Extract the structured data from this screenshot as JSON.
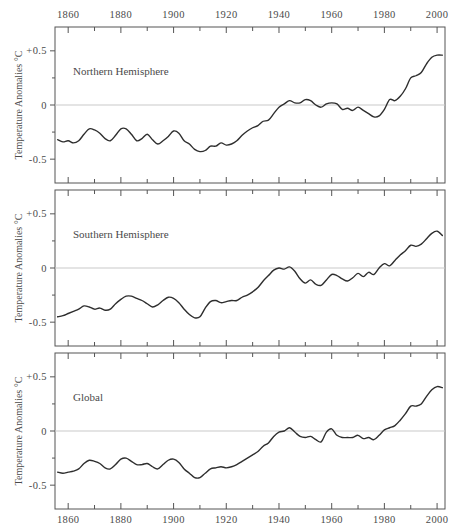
{
  "figure": {
    "xlabel": "YEAR",
    "ylabel": "Temperature Anomalies °C",
    "x_ticklabels": [
      "1860",
      "1880",
      "1900",
      "1920",
      "1940",
      "1960",
      "1980",
      "2000"
    ],
    "x_tickvalues": [
      1860,
      1880,
      1900,
      1920,
      1940,
      1960,
      1980,
      2000
    ],
    "x_minor_step": 10,
    "y_ticklabels": [
      "+0.5",
      "0",
      "-0.5"
    ],
    "y_tickvalues": [
      0.5,
      0,
      -0.5
    ],
    "axis_top_labels": true,
    "axis_bottom_labels": true,
    "curve_color": "#2e2e2e",
    "zero_line_color": "#c9c9c9",
    "frame_color": "#555555",
    "background": "#ffffff"
  },
  "chart_data": {
    "type": "line",
    "title": "",
    "xlabel": "YEAR",
    "ylabel": "Temperature Anomalies °C",
    "xlim": [
      1855,
      2003
    ],
    "ylim": [
      -0.72,
      0.72
    ],
    "grid": false,
    "legend": "none",
    "annotations": [
      "Northern Hemisphere",
      "Southern Hemisphere",
      "Global"
    ],
    "panels": [
      {
        "label": "Northern Hemisphere",
        "x": [
          1856,
          1858,
          1860,
          1862,
          1864,
          1866,
          1868,
          1870,
          1872,
          1874,
          1876,
          1878,
          1880,
          1882,
          1884,
          1886,
          1888,
          1890,
          1892,
          1894,
          1896,
          1898,
          1900,
          1902,
          1904,
          1906,
          1908,
          1910,
          1912,
          1914,
          1916,
          1918,
          1920,
          1922,
          1924,
          1926,
          1928,
          1930,
          1932,
          1934,
          1936,
          1938,
          1940,
          1942,
          1944,
          1946,
          1948,
          1950,
          1952,
          1954,
          1956,
          1958,
          1960,
          1962,
          1964,
          1966,
          1968,
          1970,
          1972,
          1974,
          1976,
          1978,
          1980,
          1982,
          1984,
          1986,
          1988,
          1990,
          1992,
          1994,
          1996,
          1998,
          2000,
          2002
        ],
        "y": [
          -0.32,
          -0.34,
          -0.33,
          -0.35,
          -0.33,
          -0.27,
          -0.22,
          -0.23,
          -0.26,
          -0.31,
          -0.33,
          -0.28,
          -0.22,
          -0.22,
          -0.27,
          -0.33,
          -0.31,
          -0.27,
          -0.32,
          -0.36,
          -0.33,
          -0.29,
          -0.24,
          -0.26,
          -0.33,
          -0.36,
          -0.41,
          -0.43,
          -0.42,
          -0.38,
          -0.38,
          -0.35,
          -0.37,
          -0.36,
          -0.33,
          -0.28,
          -0.24,
          -0.21,
          -0.19,
          -0.15,
          -0.14,
          -0.08,
          -0.02,
          0.01,
          0.04,
          0.02,
          0.02,
          0.05,
          0.04,
          0.0,
          -0.02,
          0.01,
          0.02,
          0.01,
          -0.04,
          -0.03,
          -0.05,
          -0.02,
          -0.05,
          -0.08,
          -0.11,
          -0.1,
          -0.04,
          0.05,
          0.04,
          0.08,
          0.15,
          0.25,
          0.27,
          0.3,
          0.38,
          0.44,
          0.46,
          0.46
        ],
        "ymin_observed": -0.43,
        "ymax_observed": 0.47
      },
      {
        "label": "Southern Hemisphere",
        "x": [
          1856,
          1858,
          1860,
          1862,
          1864,
          1866,
          1868,
          1870,
          1872,
          1874,
          1876,
          1878,
          1880,
          1882,
          1884,
          1886,
          1888,
          1890,
          1892,
          1894,
          1896,
          1898,
          1900,
          1902,
          1904,
          1906,
          1908,
          1910,
          1912,
          1914,
          1916,
          1918,
          1920,
          1922,
          1924,
          1926,
          1928,
          1930,
          1932,
          1934,
          1936,
          1938,
          1940,
          1942,
          1944,
          1946,
          1948,
          1950,
          1952,
          1954,
          1956,
          1958,
          1960,
          1962,
          1964,
          1966,
          1968,
          1970,
          1972,
          1974,
          1976,
          1978,
          1980,
          1982,
          1984,
          1986,
          1988,
          1990,
          1992,
          1994,
          1996,
          1998,
          2000,
          2002
        ],
        "y": [
          -0.45,
          -0.44,
          -0.42,
          -0.4,
          -0.38,
          -0.35,
          -0.36,
          -0.38,
          -0.37,
          -0.39,
          -0.38,
          -0.33,
          -0.29,
          -0.26,
          -0.26,
          -0.28,
          -0.3,
          -0.33,
          -0.36,
          -0.34,
          -0.3,
          -0.27,
          -0.28,
          -0.32,
          -0.38,
          -0.43,
          -0.46,
          -0.45,
          -0.37,
          -0.31,
          -0.3,
          -0.32,
          -0.31,
          -0.3,
          -0.3,
          -0.27,
          -0.25,
          -0.22,
          -0.18,
          -0.12,
          -0.07,
          -0.02,
          0.0,
          -0.01,
          0.01,
          -0.03,
          -0.1,
          -0.14,
          -0.11,
          -0.15,
          -0.16,
          -0.11,
          -0.06,
          -0.07,
          -0.1,
          -0.12,
          -0.09,
          -0.05,
          -0.08,
          -0.04,
          -0.06,
          0.0,
          0.04,
          0.02,
          0.07,
          0.12,
          0.16,
          0.21,
          0.2,
          0.22,
          0.27,
          0.32,
          0.34,
          0.3
        ],
        "ymin_observed": -0.46,
        "ymax_observed": 0.34
      },
      {
        "label": "Global",
        "x": [
          1856,
          1858,
          1860,
          1862,
          1864,
          1866,
          1868,
          1870,
          1872,
          1874,
          1876,
          1878,
          1880,
          1882,
          1884,
          1886,
          1888,
          1890,
          1892,
          1894,
          1896,
          1898,
          1900,
          1902,
          1904,
          1906,
          1908,
          1910,
          1912,
          1914,
          1916,
          1918,
          1920,
          1922,
          1924,
          1926,
          1928,
          1930,
          1932,
          1934,
          1936,
          1938,
          1940,
          1942,
          1944,
          1946,
          1948,
          1950,
          1952,
          1954,
          1956,
          1958,
          1960,
          1962,
          1964,
          1966,
          1968,
          1970,
          1972,
          1974,
          1976,
          1978,
          1980,
          1982,
          1984,
          1986,
          1988,
          1990,
          1992,
          1994,
          1996,
          1998,
          2000,
          2002
        ],
        "y": [
          -0.38,
          -0.39,
          -0.38,
          -0.37,
          -0.35,
          -0.3,
          -0.27,
          -0.28,
          -0.3,
          -0.34,
          -0.35,
          -0.31,
          -0.26,
          -0.25,
          -0.28,
          -0.31,
          -0.31,
          -0.3,
          -0.33,
          -0.35,
          -0.31,
          -0.27,
          -0.26,
          -0.29,
          -0.35,
          -0.39,
          -0.43,
          -0.43,
          -0.39,
          -0.35,
          -0.34,
          -0.33,
          -0.34,
          -0.33,
          -0.31,
          -0.28,
          -0.25,
          -0.22,
          -0.19,
          -0.14,
          -0.11,
          -0.05,
          -0.01,
          0.0,
          0.03,
          -0.01,
          -0.05,
          -0.06,
          -0.05,
          -0.08,
          -0.1,
          -0.01,
          0.02,
          -0.04,
          -0.06,
          -0.06,
          -0.06,
          -0.04,
          -0.07,
          -0.06,
          -0.08,
          -0.04,
          0.01,
          0.03,
          0.05,
          0.1,
          0.16,
          0.23,
          0.23,
          0.25,
          0.32,
          0.38,
          0.41,
          0.4
        ],
        "ymin_observed": -0.43,
        "ymax_observed": 0.42
      }
    ]
  }
}
